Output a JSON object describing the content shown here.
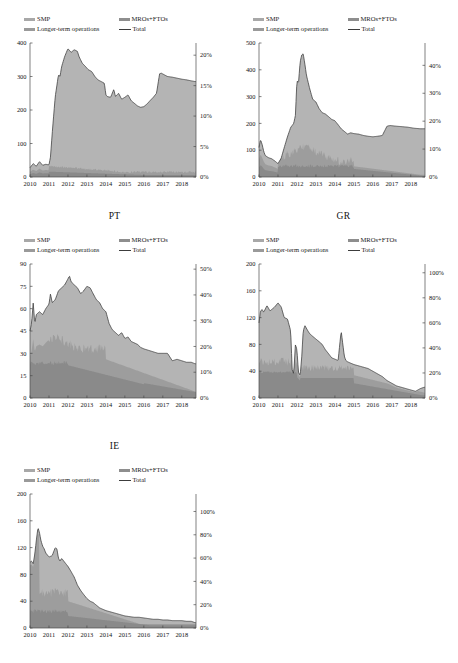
{
  "figure": {
    "background": "#ffffff",
    "legend": {
      "smp": "SMP",
      "mro": "MROs+FTOs",
      "lto": "Longer-term operations",
      "total": "Total"
    },
    "colors": {
      "smp": "#b4b4b4",
      "mro": "#9d9d9d",
      "lto": "#8a8a8a",
      "total_line": "#3a3a3a",
      "axis": "#4a4a4a"
    },
    "panel_titles": {
      "p1": "",
      "p2": "",
      "p3": "PT",
      "p4": "GR",
      "p5": "IE"
    }
  },
  "chart_data": [
    {
      "id": "panel-1",
      "type": "area",
      "title": "",
      "title_note": "title cropped at top edge of image",
      "xlabel": "",
      "ylabel": "",
      "x": [
        2010,
        2011,
        2012,
        2013,
        2014,
        2015,
        2016,
        2017,
        2018
      ],
      "xtick_labels": [
        "2010",
        "2011",
        "2012",
        "2013",
        "2014",
        "2015",
        "2016",
        "2017",
        "2018"
      ],
      "xlim": [
        2010,
        2018.75
      ],
      "ylim": [
        0,
        400
      ],
      "ytick_labels": [
        "0",
        "100",
        "200",
        "300",
        "400"
      ],
      "ytick_values": [
        0,
        100,
        200,
        300,
        400
      ],
      "y2lim": [
        0,
        22
      ],
      "y2tick_labels": [
        "0%",
        "5%",
        "10%",
        "15%",
        "20%"
      ],
      "y2tick_values": [
        0,
        5,
        10,
        15,
        20
      ],
      "grid": false,
      "legend_position": "above-plot",
      "series": [
        {
          "name": "Total",
          "kind": "line",
          "x": [
            2010.0,
            2010.17,
            2010.33,
            2010.5,
            2010.67,
            2010.83,
            2011.0,
            2011.08,
            2011.17,
            2011.33,
            2011.5,
            2011.58,
            2011.67,
            2011.83,
            2012.0,
            2012.17,
            2012.33,
            2012.5,
            2012.58,
            2012.75,
            2012.92,
            2013.08,
            2013.25,
            2013.42,
            2013.58,
            2013.75,
            2013.92,
            2014.0,
            2014.08,
            2014.25,
            2014.42,
            2014.5,
            2014.58,
            2014.67,
            2014.83,
            2015.0,
            2015.17,
            2015.33,
            2015.5,
            2015.67,
            2015.83,
            2016.0,
            2016.17,
            2016.33,
            2016.5,
            2016.67,
            2016.83,
            2016.92,
            2017.08,
            2017.25,
            2017.5,
            2017.75,
            2018.0,
            2018.25,
            2018.5,
            2018.7
          ],
          "values": [
            28,
            40,
            32,
            46,
            35,
            38,
            36,
            60,
            130,
            240,
            305,
            300,
            330,
            360,
            383,
            372,
            380,
            375,
            360,
            340,
            330,
            320,
            315,
            300,
            290,
            285,
            280,
            245,
            240,
            238,
            262,
            240,
            245,
            250,
            232,
            238,
            245,
            228,
            220,
            212,
            208,
            210,
            218,
            228,
            238,
            250,
            308,
            310,
            305,
            300,
            298,
            295,
            292,
            290,
            287,
            285
          ]
        },
        {
          "name": "SMP",
          "kind": "area",
          "note": "light grey band occupying bulk of the stack"
        },
        {
          "name": "MROs+FTOs",
          "kind": "area",
          "note": "thin darker band near baseline, roughly 10-50 bn"
        },
        {
          "name": "Longer-term operations",
          "kind": "area",
          "note": "darker lower band"
        }
      ]
    },
    {
      "id": "panel-2",
      "type": "area",
      "title": "",
      "title_note": "title cropped at top edge of image",
      "x": [
        2010,
        2011,
        2012,
        2013,
        2014,
        2015,
        2016,
        2017,
        2018
      ],
      "xtick_labels": [
        "2010",
        "2011",
        "2012",
        "2013",
        "2014",
        "2015",
        "2016",
        "2017",
        "2018"
      ],
      "xlim": [
        2010,
        2018.75
      ],
      "ylim": [
        0,
        500
      ],
      "ytick_labels": [
        "0",
        "100",
        "200",
        "300",
        "400",
        "500"
      ],
      "ytick_values": [
        0,
        100,
        200,
        300,
        400,
        500
      ],
      "y2lim": [
        0,
        48
      ],
      "y2tick_labels": [
        "0%",
        "10%",
        "20%",
        "30%",
        "40%"
      ],
      "y2tick_values": [
        0,
        10,
        20,
        30,
        40
      ],
      "grid": false,
      "legend_position": "above-plot",
      "series": [
        {
          "name": "Total",
          "kind": "line",
          "x": [
            2010.0,
            2010.08,
            2010.17,
            2010.25,
            2010.33,
            2010.5,
            2010.67,
            2010.83,
            2011.0,
            2011.17,
            2011.33,
            2011.5,
            2011.67,
            2011.83,
            2011.92,
            2012.0,
            2012.08,
            2012.17,
            2012.25,
            2012.33,
            2012.42,
            2012.5,
            2012.67,
            2012.83,
            2013.0,
            2013.17,
            2013.33,
            2013.5,
            2013.67,
            2013.83,
            2014.0,
            2014.17,
            2014.33,
            2014.5,
            2014.67,
            2014.83,
            2015.0,
            2015.25,
            2015.5,
            2015.75,
            2016.0,
            2016.25,
            2016.5,
            2016.75,
            2016.92,
            2017.17,
            2017.5,
            2017.83,
            2018.17,
            2018.5,
            2018.7
          ],
          "values": [
            110,
            140,
            120,
            95,
            80,
            72,
            68,
            60,
            50,
            70,
            110,
            150,
            185,
            200,
            230,
            360,
            350,
            430,
            455,
            460,
            420,
            380,
            330,
            290,
            280,
            255,
            240,
            235,
            225,
            215,
            210,
            195,
            180,
            170,
            160,
            165,
            162,
            160,
            155,
            152,
            150,
            152,
            155,
            190,
            192,
            190,
            188,
            186,
            182,
            180,
            180
          ]
        },
        {
          "name": "SMP",
          "kind": "area",
          "note": "large light grey stack"
        },
        {
          "name": "MROs+FTOs",
          "kind": "area",
          "note": "spiky darker band, 30-130 bn in 2012-2014"
        },
        {
          "name": "Longer-term operations",
          "kind": "area",
          "note": "darker base band"
        }
      ]
    },
    {
      "id": "panel-3",
      "type": "area",
      "title": "PT",
      "x": [
        2010,
        2011,
        2012,
        2013,
        2014,
        2015,
        2016,
        2017,
        2018
      ],
      "xtick_labels": [
        "2010",
        "2011",
        "2012",
        "2013",
        "2014",
        "2015",
        "2016",
        "2017",
        "2018"
      ],
      "xlim": [
        2010,
        2018.75
      ],
      "ylim": [
        0,
        90
      ],
      "ytick_labels": [
        "0",
        "15",
        "30",
        "45",
        "60",
        "75",
        "90"
      ],
      "ytick_values": [
        0,
        15,
        30,
        45,
        60,
        75,
        90
      ],
      "y2lim": [
        0,
        52
      ],
      "y2tick_labels": [
        "0%",
        "10%",
        "20%",
        "30%",
        "40%",
        "50%"
      ],
      "y2tick_values": [
        0,
        10,
        20,
        30,
        40,
        50
      ],
      "grid": false,
      "legend_position": "above-plot",
      "series": [
        {
          "name": "Total",
          "kind": "line",
          "x": [
            2010.0,
            2010.08,
            2010.17,
            2010.25,
            2010.33,
            2010.5,
            2010.67,
            2010.83,
            2011.0,
            2011.08,
            2011.17,
            2011.33,
            2011.5,
            2011.67,
            2011.83,
            2012.0,
            2012.08,
            2012.17,
            2012.33,
            2012.5,
            2012.67,
            2012.83,
            2013.0,
            2013.17,
            2013.33,
            2013.5,
            2013.67,
            2013.83,
            2014.0,
            2014.17,
            2014.33,
            2014.5,
            2014.67,
            2014.83,
            2015.0,
            2015.17,
            2015.33,
            2015.5,
            2015.67,
            2015.83,
            2016.0,
            2016.25,
            2016.5,
            2016.75,
            2017.0,
            2017.25,
            2017.5,
            2017.75,
            2018.0,
            2018.25,
            2018.5,
            2018.7
          ],
          "values": [
            45,
            50,
            64,
            50,
            56,
            58,
            56,
            60,
            63,
            70,
            64,
            66,
            72,
            74,
            76,
            80,
            82,
            78,
            76,
            74,
            70,
            72,
            75,
            74,
            70,
            66,
            64,
            60,
            58,
            50,
            46,
            44,
            42,
            44,
            40,
            41,
            38,
            37,
            36,
            34,
            33,
            32,
            31,
            30,
            30,
            30,
            25,
            26,
            25,
            24,
            24,
            23
          ]
        },
        {
          "name": "SMP",
          "kind": "area",
          "note": "upper light grey band"
        },
        {
          "name": "MROs+FTOs",
          "kind": "area",
          "note": "mid darker band peaking near 38 in 2011"
        },
        {
          "name": "Longer-term operations",
          "kind": "area",
          "note": "base band ~23 falling to ~5"
        }
      ]
    },
    {
      "id": "panel-4",
      "type": "area",
      "title": "GR",
      "x": [
        2010,
        2011,
        2012,
        2013,
        2014,
        2015,
        2016,
        2017,
        2018
      ],
      "xtick_labels": [
        "2010",
        "2011",
        "2012",
        "2013",
        "2014",
        "2015",
        "2016",
        "2017",
        "2018"
      ],
      "xlim": [
        2010,
        2018.75
      ],
      "ylim": [
        0,
        200
      ],
      "ytick_labels": [
        "0",
        "40",
        "80",
        "120",
        "160",
        "200"
      ],
      "ytick_values": [
        0,
        40,
        80,
        120,
        160,
        200
      ],
      "y2lim": [
        0,
        107
      ],
      "y2tick_labels": [
        "0%",
        "20%",
        "40%",
        "60%",
        "80%",
        "100%"
      ],
      "y2tick_values": [
        0,
        20,
        40,
        60,
        80,
        100
      ],
      "grid": false,
      "legend_position": "above-plot",
      "series": [
        {
          "name": "Total",
          "kind": "line",
          "x": [
            2010.0,
            2010.08,
            2010.17,
            2010.25,
            2010.42,
            2010.58,
            2010.75,
            2010.83,
            2011.0,
            2011.17,
            2011.33,
            2011.5,
            2011.67,
            2011.75,
            2011.83,
            2011.92,
            2012.0,
            2012.08,
            2012.17,
            2012.25,
            2012.33,
            2012.42,
            2012.5,
            2012.58,
            2012.67,
            2012.83,
            2013.0,
            2013.17,
            2013.33,
            2013.5,
            2013.67,
            2013.83,
            2014.0,
            2014.17,
            2014.33,
            2014.5,
            2014.58,
            2014.67,
            2014.83,
            2015.0,
            2015.25,
            2015.5,
            2015.75,
            2016.0,
            2016.25,
            2016.5,
            2016.75,
            2017.0,
            2017.25,
            2017.5,
            2017.75,
            2018.0,
            2018.25,
            2018.5,
            2018.7
          ],
          "values": [
            112,
            130,
            132,
            128,
            138,
            130,
            134,
            136,
            142,
            136,
            120,
            118,
            100,
            42,
            36,
            80,
            72,
            38,
            34,
            60,
            100,
            108,
            104,
            100,
            96,
            92,
            88,
            84,
            80,
            72,
            66,
            60,
            58,
            56,
            100,
            62,
            56,
            54,
            52,
            50,
            48,
            46,
            44,
            40,
            36,
            32,
            26,
            22,
            18,
            16,
            14,
            12,
            10,
            14,
            16
          ]
        },
        {
          "name": "SMP",
          "kind": "area",
          "note": "upper light grey band"
        },
        {
          "name": "MROs+FTOs",
          "kind": "area",
          "note": "darker band; prominent 2010-2012"
        },
        {
          "name": "Longer-term operations",
          "kind": "area",
          "note": "base band near 36-40 in 2010-2011"
        }
      ]
    },
    {
      "id": "panel-5",
      "type": "area",
      "title": "IE",
      "x": [
        2010,
        2011,
        2012,
        2013,
        2014,
        2015,
        2016,
        2017,
        2018
      ],
      "xtick_labels": [
        "2010",
        "2011",
        "2012",
        "2013",
        "2014",
        "2015",
        "2016",
        "2017",
        "2018"
      ],
      "xlim": [
        2010,
        2018.75
      ],
      "ylim": [
        0,
        200
      ],
      "ytick_labels": [
        "0",
        "40",
        "80",
        "120",
        "160",
        "200"
      ],
      "ytick_values": [
        0,
        40,
        80,
        120,
        160,
        200
      ],
      "y2lim": [
        0,
        115
      ],
      "y2tick_labels": [
        "0%",
        "20%",
        "40%",
        "60%",
        "80%",
        "100%"
      ],
      "y2tick_values": [
        0,
        20,
        40,
        60,
        80,
        100
      ],
      "grid": false,
      "legend_position": "above-plot",
      "series": [
        {
          "name": "Total",
          "kind": "line",
          "x": [
            2010.0,
            2010.08,
            2010.17,
            2010.25,
            2010.33,
            2010.42,
            2010.5,
            2010.58,
            2010.67,
            2010.75,
            2010.83,
            2011.0,
            2011.17,
            2011.33,
            2011.42,
            2011.5,
            2011.58,
            2011.67,
            2011.83,
            2012.0,
            2012.17,
            2012.33,
            2012.5,
            2012.67,
            2012.83,
            2013.0,
            2013.17,
            2013.33,
            2013.5,
            2013.67,
            2013.83,
            2014.0,
            2014.25,
            2014.5,
            2014.75,
            2015.0,
            2015.25,
            2015.5,
            2015.75,
            2016.0,
            2016.25,
            2016.5,
            2016.75,
            2017.0,
            2017.25,
            2017.5,
            2017.75,
            2018.0,
            2018.25,
            2018.5,
            2018.7
          ],
          "values": [
            98,
            100,
            96,
            110,
            130,
            150,
            142,
            130,
            122,
            118,
            112,
            106,
            108,
            120,
            118,
            104,
            100,
            104,
            98,
            92,
            84,
            76,
            64,
            56,
            50,
            44,
            40,
            38,
            34,
            30,
            28,
            26,
            24,
            22,
            20,
            18,
            17,
            16,
            16,
            15,
            14,
            13,
            13,
            12,
            12,
            11,
            11,
            11,
            10,
            10,
            8
          ]
        },
        {
          "name": "SMP",
          "kind": "area",
          "note": "upper light grey band"
        },
        {
          "name": "MROs+FTOs",
          "kind": "area",
          "note": "darker band dominating 2010-2012"
        },
        {
          "name": "Longer-term operations",
          "kind": "area",
          "note": "base band"
        }
      ]
    }
  ]
}
